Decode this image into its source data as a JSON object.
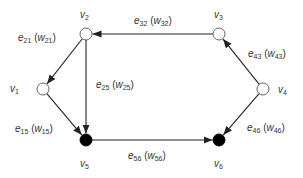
{
  "diagram": {
    "type": "directed-graph",
    "colors": {
      "edge": "#222222",
      "open_node_fill": "#ffffff",
      "sink_node_fill": "#000000",
      "label": "#333333"
    },
    "nodes": [
      {
        "id": "v1",
        "base": "v",
        "sub": "1",
        "x": 43,
        "y": 89,
        "filled": false,
        "label_x": 10,
        "label_y": 84
      },
      {
        "id": "v2",
        "base": "v",
        "sub": "2",
        "x": 86,
        "y": 34,
        "filled": false,
        "label_x": 80,
        "label_y": 10
      },
      {
        "id": "v3",
        "base": "v",
        "sub": "3",
        "x": 219,
        "y": 34,
        "filled": false,
        "label_x": 214,
        "label_y": 10
      },
      {
        "id": "v4",
        "base": "v",
        "sub": "4",
        "x": 263,
        "y": 89,
        "filled": false,
        "label_x": 278,
        "label_y": 85
      },
      {
        "id": "v5",
        "base": "v",
        "sub": "5",
        "x": 86,
        "y": 140,
        "filled": true,
        "label_x": 80,
        "label_y": 159
      },
      {
        "id": "v6",
        "base": "v",
        "sub": "6",
        "x": 219,
        "y": 140,
        "filled": true,
        "label_x": 214,
        "label_y": 159
      }
    ],
    "edges": [
      {
        "id": "e21",
        "from": "v2",
        "to": "v1",
        "label": "e",
        "sub": "21",
        "weight": "w",
        "wsub": "21",
        "label_x": 18,
        "label_y": 33
      },
      {
        "id": "e32",
        "from": "v3",
        "to": "v2",
        "label": "e",
        "sub": "32",
        "weight": "w",
        "wsub": "32",
        "label_x": 134,
        "label_y": 16
      },
      {
        "id": "e25",
        "from": "v2",
        "to": "v5",
        "label": "e",
        "sub": "25",
        "weight": "w",
        "wsub": "25",
        "label_x": 96,
        "label_y": 80
      },
      {
        "id": "e15",
        "from": "v1",
        "to": "v5",
        "label": "e",
        "sub": "15",
        "weight": "w",
        "wsub": "15",
        "label_x": 15,
        "label_y": 124
      },
      {
        "id": "e43",
        "from": "v4",
        "to": "v3",
        "label": "e",
        "sub": "43",
        "weight": "w",
        "wsub": "43",
        "label_x": 248,
        "label_y": 49
      },
      {
        "id": "e56",
        "from": "v5",
        "to": "v6",
        "label": "e",
        "sub": "56",
        "weight": "w",
        "wsub": "56",
        "label_x": 128,
        "label_y": 151
      },
      {
        "id": "e46",
        "from": "v4",
        "to": "v6",
        "label": "e",
        "sub": "46",
        "weight": "w",
        "wsub": "46",
        "label_x": 247,
        "label_y": 123
      }
    ]
  }
}
